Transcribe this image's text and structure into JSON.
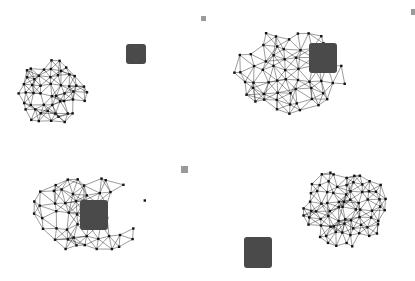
{
  "figure": {
    "panels": [
      {
        "id": "top-left",
        "mesh": {
          "cx": 52,
          "cy": 93,
          "rx": 36,
          "ry": 33,
          "shape": "circle"
        },
        "blob": {
          "x": 126,
          "y": 44,
          "w": 20,
          "h": 20
        },
        "marker": {
          "x": 201,
          "y": 16,
          "w": 5,
          "h": 5
        }
      },
      {
        "id": "top-right",
        "mesh": {
          "cx": 290,
          "cy": 70,
          "rx": 58,
          "ry": 45,
          "shape": "irregular"
        },
        "blob": {
          "x": 309,
          "y": 43,
          "w": 28,
          "h": 30
        },
        "marker": {
          "x": 411,
          "y": 9,
          "w": 4,
          "h": 6
        }
      },
      {
        "id": "bottom-left",
        "mesh": {
          "cx": 90,
          "cy": 213,
          "rx": 58,
          "ry": 42,
          "shape": "crescent"
        },
        "blob": {
          "x": 80,
          "y": 200,
          "w": 28,
          "h": 30
        },
        "marker": {
          "x": 181,
          "y": 166,
          "w": 7,
          "h": 7
        }
      },
      {
        "id": "bottom-right",
        "mesh": {
          "cx": 345,
          "cy": 207,
          "rx": 43,
          "ry": 40,
          "shape": "oval"
        },
        "blob": {
          "x": 244,
          "y": 237,
          "w": 28,
          "h": 31
        },
        "marker": null
      }
    ],
    "colors": {
      "edge": "#222222",
      "node": "#111111",
      "blob": "#4a4a4a",
      "marker": "#9a9a9a",
      "background": "#ffffff"
    }
  }
}
